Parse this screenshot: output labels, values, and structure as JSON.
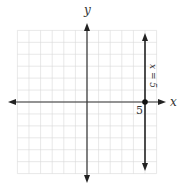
{
  "chart_data": {
    "type": "line",
    "title": "",
    "xlabel": "x",
    "ylabel": "y",
    "xlim": [
      -6,
      6
    ],
    "ylim": [
      -6,
      6
    ],
    "grid": true,
    "series": [
      {
        "name": "x = 5",
        "kind": "vertical-line",
        "x": 5,
        "label": "x = 5"
      }
    ],
    "points": [
      {
        "x": 5,
        "y": 0,
        "label": "5"
      }
    ],
    "annotations": [
      {
        "text": "x = 5",
        "orientation": "rotated-90",
        "position": "right of line, above x-axis"
      },
      {
        "text": "5",
        "position": "below-left of point (5,0)"
      }
    ]
  },
  "labels": {
    "x_axis": "x",
    "y_axis": "y",
    "line_label": "x = 5",
    "tick_5": "5"
  }
}
